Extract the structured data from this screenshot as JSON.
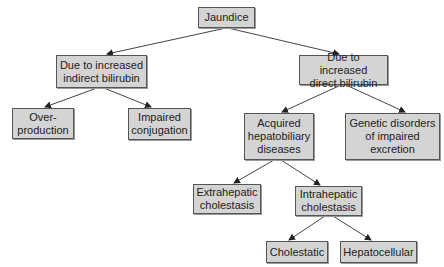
{
  "diagram": {
    "title": "Jaundice",
    "colors": {
      "node_fill": "#d4d4d4",
      "node_border": "#555555",
      "edge": "#444444",
      "text": "#222222"
    },
    "nodes": {
      "jaundice": {
        "label": "Jaundice"
      },
      "indirect": {
        "label": "Due to increased\nindirect bilirubin"
      },
      "direct": {
        "label": "Due to increased\ndirect bilirubin"
      },
      "overproduction": {
        "label": "Over-\nproduction"
      },
      "impaired_conjugation": {
        "label": "Impaired\nconjugation"
      },
      "acquired": {
        "label": "Acquired\nhepatobiliary\ndiseases"
      },
      "genetic": {
        "label": "Genetic disorders\nof impaired\nexcretion"
      },
      "extrahepatic": {
        "label": "Extrahepatic\ncholestasis"
      },
      "intrahepatic": {
        "label": "Intrahepatic\ncholestasis"
      },
      "cholestatic": {
        "label": "Cholestatic"
      },
      "hepatocellular": {
        "label": "Hepatocellular"
      }
    },
    "edges": [
      [
        "jaundice",
        "indirect"
      ],
      [
        "jaundice",
        "direct"
      ],
      [
        "indirect",
        "overproduction"
      ],
      [
        "indirect",
        "impaired_conjugation"
      ],
      [
        "direct",
        "acquired"
      ],
      [
        "direct",
        "genetic"
      ],
      [
        "acquired",
        "extrahepatic"
      ],
      [
        "acquired",
        "intrahepatic"
      ],
      [
        "intrahepatic",
        "cholestatic"
      ],
      [
        "intrahepatic",
        "hepatocellular"
      ]
    ]
  }
}
